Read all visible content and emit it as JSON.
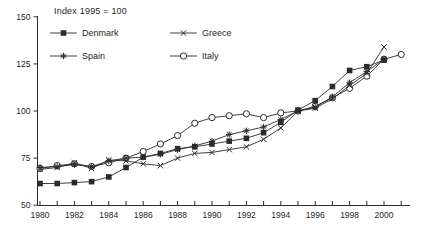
{
  "chart_data": {
    "type": "line",
    "title": "Index 1995 = 100",
    "xlabel": "",
    "ylabel": "",
    "ylim": [
      50,
      150
    ],
    "yticks": [
      50,
      75,
      100,
      125,
      150
    ],
    "x": [
      1980,
      1981,
      1982,
      1983,
      1984,
      1985,
      1986,
      1987,
      1988,
      1989,
      1990,
      1991,
      1992,
      1993,
      1994,
      1995,
      1996,
      1997,
      1998,
      1999,
      2000,
      2001
    ],
    "xtick_labels": [
      1980,
      1982,
      1984,
      1986,
      1988,
      1990,
      1992,
      1994,
      1996,
      1998,
      2000
    ],
    "grid": false,
    "legend_position": "top-left-inside",
    "line_color": "#2b2b2b",
    "series": [
      {
        "name": "Denmark",
        "marker": "filled-square",
        "values": [
          61.5,
          61.5,
          62,
          62.5,
          65,
          70,
          75.5,
          77.5,
          80,
          81,
          82.5,
          84,
          85.5,
          88.5,
          94,
          100.5,
          105.5,
          113,
          121.5,
          123.5,
          127,
          null
        ]
      },
      {
        "name": "Greece",
        "marker": "x-cross",
        "values": [
          69,
          70,
          72.5,
          69.5,
          74,
          73.5,
          72,
          71,
          75,
          77.5,
          78,
          79.5,
          81,
          85,
          91,
          100,
          101.5,
          106.5,
          113.5,
          120,
          134,
          null
        ]
      },
      {
        "name": "Spain",
        "marker": "asterisk",
        "values": [
          70,
          70.5,
          71.5,
          70.5,
          73.5,
          75,
          75.5,
          77,
          79.5,
          81.5,
          84,
          87.5,
          89.5,
          91.5,
          95.5,
          100,
          102,
          107.5,
          115,
          121,
          127.5,
          null
        ]
      },
      {
        "name": "Italy",
        "marker": "open-circle",
        "values": [
          69.5,
          71,
          72,
          70.5,
          72.5,
          75,
          78.5,
          82.5,
          87,
          93.5,
          96.5,
          97.5,
          98.5,
          96.5,
          99,
          100,
          102.5,
          107,
          112,
          118.5,
          127.5,
          130
        ]
      }
    ]
  }
}
